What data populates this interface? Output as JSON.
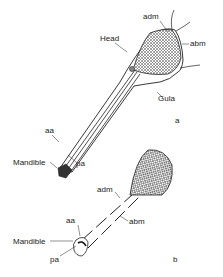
{
  "figure_a": {
    "panel_label": "a",
    "labels": {
      "head": "Head",
      "adm": "adm",
      "abm": "abm",
      "gula": "Gula",
      "aa": "aa",
      "mandible": "Mandible",
      "pa": "pa"
    }
  },
  "figure_b": {
    "panel_label": "b",
    "labels": {
      "adm": "adm",
      "abm": "abm",
      "aa": "aa",
      "mandible": "Mandible",
      "pa": "pa"
    }
  },
  "colors": {
    "ink": "#222222",
    "background": "#ffffff"
  }
}
